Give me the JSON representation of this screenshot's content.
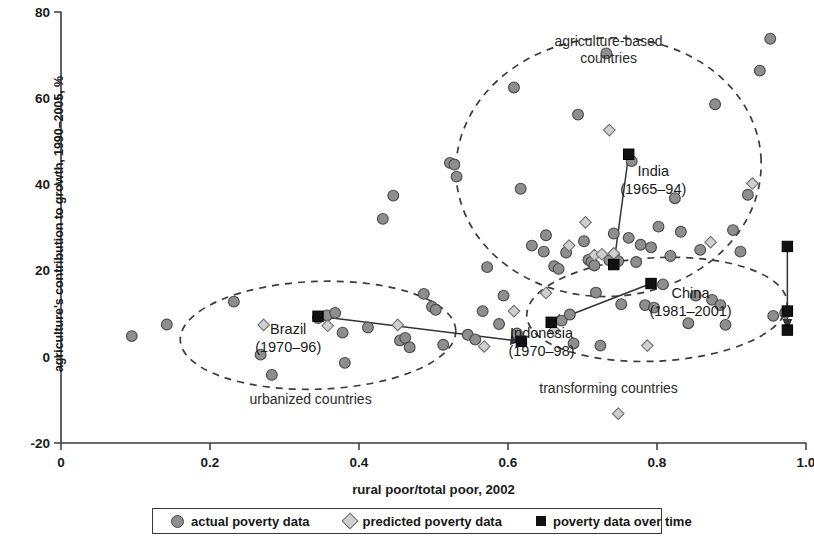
{
  "chart_data": {
    "type": "scatter",
    "title": "",
    "xlabel": "rural poor/total poor, 2002",
    "ylabel": "agriculture's contribution to growth, 1990–2005, %",
    "xlim": [
      0,
      1.0
    ],
    "ylim": [
      -20,
      80
    ],
    "xticks": [
      "0",
      "0.2",
      "0.4",
      "0.6",
      "0.8",
      "1.0"
    ],
    "xtick_values": [
      0,
      0.2,
      0.4,
      0.6,
      0.8,
      1.0
    ],
    "yticks": [
      "-20",
      "0",
      "20",
      "40",
      "60",
      "80"
    ],
    "ytick_values": [
      -20,
      0,
      20,
      40,
      60,
      80
    ],
    "grid": false,
    "legend_position": "below-axis",
    "legend": [
      {
        "key": "actual",
        "label": "actual poverty data",
        "marker": "circle",
        "color": "#8e8e8e"
      },
      {
        "key": "predicted",
        "label": "predicted poverty data",
        "marker": "diamond",
        "color": "#cfcfcf"
      },
      {
        "key": "over_time",
        "label": "poverty data over time",
        "marker": "square",
        "color": "#111111"
      }
    ],
    "series": [
      {
        "name": "actual poverty data",
        "marker": "circle",
        "color": "#8e8e8e",
        "points": [
          [
            0.095,
            4.8
          ],
          [
            0.142,
            7.5
          ],
          [
            0.232,
            12.8
          ],
          [
            0.268,
            0.5
          ],
          [
            0.283,
            -4.2
          ],
          [
            0.345,
            9.0
          ],
          [
            0.357,
            9.6
          ],
          [
            0.368,
            10.2
          ],
          [
            0.378,
            5.6
          ],
          [
            0.381,
            -1.4
          ],
          [
            0.412,
            6.8
          ],
          [
            0.432,
            32.0
          ],
          [
            0.446,
            37.4
          ],
          [
            0.455,
            3.8
          ],
          [
            0.462,
            4.4
          ],
          [
            0.468,
            2.2
          ],
          [
            0.487,
            14.6
          ],
          [
            0.498,
            11.6
          ],
          [
            0.503,
            10.9
          ],
          [
            0.513,
            2.8
          ],
          [
            0.522,
            45.0
          ],
          [
            0.528,
            44.6
          ],
          [
            0.531,
            41.8
          ],
          [
            0.546,
            5.1
          ],
          [
            0.556,
            4.0
          ],
          [
            0.566,
            10.6
          ],
          [
            0.572,
            20.8
          ],
          [
            0.588,
            7.6
          ],
          [
            0.594,
            14.2
          ],
          [
            0.608,
            62.5
          ],
          [
            0.612,
            5.4
          ],
          [
            0.617,
            39.0
          ],
          [
            0.632,
            25.8
          ],
          [
            0.648,
            24.4
          ],
          [
            0.651,
            28.2
          ],
          [
            0.662,
            21.0
          ],
          [
            0.668,
            20.4
          ],
          [
            0.672,
            8.4
          ],
          [
            0.678,
            24.2
          ],
          [
            0.683,
            9.8
          ],
          [
            0.688,
            3.1
          ],
          [
            0.694,
            56.2
          ],
          [
            0.702,
            26.8
          ],
          [
            0.708,
            22.5
          ],
          [
            0.712,
            22.0
          ],
          [
            0.716,
            21.2
          ],
          [
            0.718,
            14.9
          ],
          [
            0.724,
            2.6
          ],
          [
            0.732,
            70.4
          ],
          [
            0.736,
            22.4
          ],
          [
            0.742,
            28.6
          ],
          [
            0.748,
            22.2
          ],
          [
            0.752,
            12.2
          ],
          [
            0.762,
            27.6
          ],
          [
            0.766,
            45.4
          ],
          [
            0.772,
            22.0
          ],
          [
            0.778,
            26.0
          ],
          [
            0.784,
            12.0
          ],
          [
            0.792,
            25.4
          ],
          [
            0.796,
            11.4
          ],
          [
            0.802,
            30.2
          ],
          [
            0.808,
            16.8
          ],
          [
            0.818,
            23.4
          ],
          [
            0.824,
            36.8
          ],
          [
            0.832,
            29.0
          ],
          [
            0.842,
            7.8
          ],
          [
            0.852,
            14.2
          ],
          [
            0.858,
            24.8
          ],
          [
            0.874,
            13.2
          ],
          [
            0.878,
            58.6
          ],
          [
            0.885,
            12.0
          ],
          [
            0.892,
            7.4
          ],
          [
            0.902,
            29.4
          ],
          [
            0.912,
            24.4
          ],
          [
            0.922,
            37.6
          ],
          [
            0.938,
            66.4
          ],
          [
            0.952,
            73.8
          ],
          [
            0.956,
            9.5
          ],
          [
            0.972,
            10.2
          ]
        ]
      },
      {
        "name": "predicted poverty data",
        "marker": "diamond",
        "color": "#cfcfcf",
        "points": [
          [
            0.272,
            7.4
          ],
          [
            0.358,
            7.2
          ],
          [
            0.452,
            7.4
          ],
          [
            0.568,
            2.4
          ],
          [
            0.608,
            10.6
          ],
          [
            0.651,
            14.8
          ],
          [
            0.662,
            6.1
          ],
          [
            0.682,
            25.8
          ],
          [
            0.704,
            31.2
          ],
          [
            0.716,
            23.6
          ],
          [
            0.726,
            23.8
          ],
          [
            0.736,
            52.6
          ],
          [
            0.742,
            24.0
          ],
          [
            0.748,
            -13.2
          ],
          [
            0.787,
            2.6
          ],
          [
            0.872,
            26.6
          ],
          [
            0.928,
            40.2
          ]
        ]
      }
    ],
    "tracks": [
      {
        "name": "Brazil",
        "period": "(1970–96)",
        "label_x": 0.305,
        "label_y": 5.4,
        "markers": [
          [
            0.345,
            9.4
          ],
          [
            0.618,
            3.6
          ]
        ],
        "path": [
          [
            0.345,
            9.4
          ],
          [
            0.618,
            3.6
          ]
        ]
      },
      {
        "name": "India",
        "period": "(1965–94)",
        "label_x": 0.795,
        "label_y": 42.0,
        "markers": [
          [
            0.762,
            47.0
          ],
          [
            0.742,
            21.4
          ]
        ],
        "path": [
          [
            0.762,
            47.0
          ],
          [
            0.742,
            21.4
          ]
        ]
      },
      {
        "name": "Indonesia",
        "period": "(1970–98)",
        "label_x": 0.645,
        "label_y": 4.4,
        "markers": [
          [
            0.792,
            17.0
          ],
          [
            0.658,
            8.0
          ]
        ],
        "path": [
          [
            0.792,
            17.0
          ],
          [
            0.658,
            8.0
          ]
        ]
      },
      {
        "name": "China",
        "period": "(1981–2001)",
        "label_x": 0.845,
        "label_y": 13.6,
        "markers": [
          [
            0.975,
            25.6
          ],
          [
            0.975,
            10.6
          ],
          [
            0.975,
            6.2
          ]
        ],
        "path": [
          [
            0.975,
            25.6
          ],
          [
            0.975,
            6.2
          ]
        ]
      }
    ],
    "group_ellipses": [
      {
        "label": "agriculture-based countries",
        "label_lines": [
          "agriculture-based",
          "countries"
        ],
        "label_x": 0.735,
        "label_y": 72.0,
        "cx": 0.735,
        "cy": 44.0,
        "rx": 0.205,
        "ry": 30.0,
        "rotation": -4
      },
      {
        "label": "urbanized countries",
        "label_lines": [
          "urbanized countries"
        ],
        "label_x": 0.335,
        "label_y": -11.0,
        "cx": 0.345,
        "cy": 5.0,
        "rx": 0.185,
        "ry": 12.5,
        "rotation": -2
      },
      {
        "label": "transforming countries",
        "label_lines": [
          "transforming countries"
        ],
        "label_x": 0.735,
        "label_y": -8.4,
        "cx": 0.8,
        "cy": 11.0,
        "rx": 0.175,
        "ry": 12.0,
        "rotation": -3
      }
    ]
  },
  "axes": {
    "x_title": "rural poor/total poor, 2002",
    "y_title": "agriculture's contribution to growth, 1990–2005, %"
  },
  "legend": {
    "items": [
      {
        "label": "actual poverty data",
        "icon": "circle-marker-icon"
      },
      {
        "label": "predicted poverty data",
        "icon": "diamond-marker-icon"
      },
      {
        "label": "poverty data over time",
        "icon": "square-marker-icon"
      }
    ]
  }
}
